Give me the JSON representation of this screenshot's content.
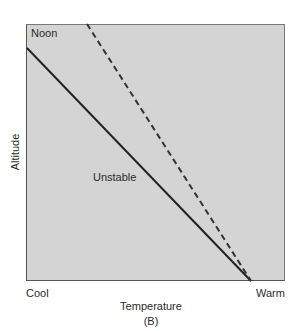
{
  "diagram": {
    "panel_label": "Noon",
    "caption": "(B)",
    "x_axis": {
      "label": "Temperature",
      "left": "Cool",
      "right": "Warm"
    },
    "y_axis": {
      "label": "Altitude"
    },
    "lines": [
      {
        "name": "environmental-lapse-rate",
        "style": "solid",
        "annotation": "Unstable"
      },
      {
        "name": "adiabatic-lapse-rate",
        "style": "dashed"
      }
    ],
    "colors": {
      "background": "#d4d4d4",
      "line": "#222222"
    }
  }
}
